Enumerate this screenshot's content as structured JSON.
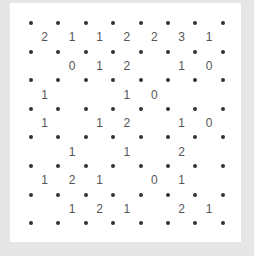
{
  "puzzle": {
    "type": "slitherlink",
    "rows": 7,
    "cols": 7,
    "dot_color": "#333333",
    "clue_color": "#555555",
    "background_color": "#e6e6e6",
    "panel_color": "#ffffff",
    "clues": [
      [
        "2",
        "1",
        "1",
        "2",
        "2",
        "3",
        "1"
      ],
      [
        "",
        "0",
        "1",
        "2",
        "",
        "1",
        "0"
      ],
      [
        "1",
        "",
        "",
        "1",
        "0",
        "",
        ""
      ],
      [
        "1",
        "",
        "1",
        "2",
        "",
        "1",
        "0"
      ],
      [
        "",
        "1",
        "",
        "1",
        "",
        "2",
        ""
      ],
      [
        "1",
        "2",
        "1",
        "",
        "0",
        "1",
        ""
      ],
      [
        "",
        "1",
        "2",
        "1",
        "",
        "2",
        "1"
      ]
    ]
  }
}
